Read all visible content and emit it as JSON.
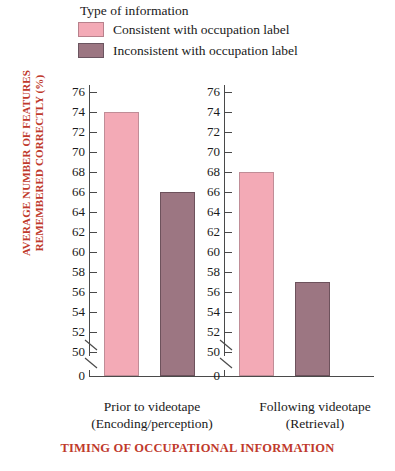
{
  "legend": {
    "title": "Type of information",
    "items": [
      {
        "label": "Consistent with occupation label",
        "color": "#f3aab6",
        "key": "consistent"
      },
      {
        "label": "Inconsistent with occupation label",
        "color": "#9c7682",
        "key": "inconsistent"
      }
    ]
  },
  "axes": {
    "y_title_line1": "AVERAGE NUMBER OF FEATURES",
    "y_title_line2": "REMEMBERED CORRECTLY (%)",
    "x_title": "TIMING OF OCCUPATIONAL INFORMATION",
    "zero_label": "0",
    "tick_labels": [
      "76",
      "74",
      "72",
      "70",
      "68",
      "66",
      "64",
      "62",
      "60",
      "58",
      "56",
      "54",
      "52",
      "50"
    ],
    "title_color": "#c0392b"
  },
  "groups": [
    {
      "line1": "Prior to videotape",
      "line2": "(Encoding/perception)"
    },
    {
      "line1": "Following videotape",
      "line2": "(Retrieval)"
    }
  ],
  "chart_data": {
    "type": "bar",
    "title": "",
    "xlabel": "TIMING OF OCCUPATIONAL INFORMATION",
    "ylabel": "AVERAGE NUMBER OF FEATURES REMEMBERED CORRECTLY (%)",
    "categories": [
      "Prior to videotape (Encoding/perception)",
      "Following videotape (Retrieval)"
    ],
    "series": [
      {
        "name": "Consistent with occupation label",
        "values": [
          74,
          68
        ],
        "color": "#f3aab6"
      },
      {
        "name": "Inconsistent with occupation label",
        "values": [
          66,
          57
        ],
        "color": "#9c7682"
      }
    ],
    "ylim": [
      50,
      77
    ],
    "ytick_step": 2,
    "yticks": [
      50,
      52,
      54,
      56,
      58,
      60,
      62,
      64,
      66,
      68,
      70,
      72,
      74,
      76
    ],
    "axis_break": true,
    "axis_break_note": "y-axis broken between 0 and 50",
    "grid": false,
    "legend_position": "top-left",
    "panels": 2
  }
}
